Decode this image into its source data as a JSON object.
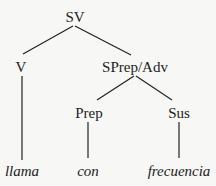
{
  "tree": {
    "root": {
      "label": "SV",
      "x": 75,
      "y": 9
    },
    "nodes": [
      {
        "id": "V",
        "label": "V",
        "x": 21,
        "y": 59
      },
      {
        "id": "SPrep",
        "label": "SPrep/Adv",
        "x": 135,
        "y": 59
      },
      {
        "id": "Prep",
        "label": "Prep",
        "x": 89,
        "y": 105
      },
      {
        "id": "Sus",
        "label": "Sus",
        "x": 179,
        "y": 105
      }
    ],
    "leaves": [
      {
        "id": "llama",
        "label": "llama",
        "x": 22,
        "y": 163
      },
      {
        "id": "con",
        "label": "con",
        "x": 88,
        "y": 163
      },
      {
        "id": "frecuencia",
        "label": "frecuencia",
        "x": 179,
        "y": 163
      }
    ]
  }
}
